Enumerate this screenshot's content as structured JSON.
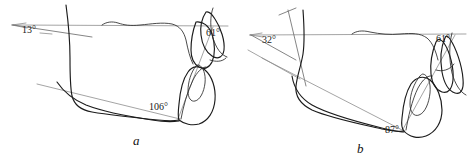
{
  "figure": {
    "title": "",
    "panels": [
      {
        "id": "a",
        "label": "a",
        "angles": [
          {
            "name": "pastern-axis-to-horizontal",
            "value": "13",
            "unit": "°",
            "text": "13°"
          },
          {
            "name": "dorsal-hoof-wall-angle",
            "value": "61",
            "unit": "°",
            "text": "61°"
          },
          {
            "name": "toe-to-ground-angle",
            "value": "106",
            "unit": "°",
            "text": "106°"
          }
        ]
      },
      {
        "id": "b",
        "label": "b",
        "angles": [
          {
            "name": "pastern-axis-to-horizontal",
            "value": "32",
            "unit": "°",
            "text": "32°"
          },
          {
            "name": "dorsal-hoof-wall-angle",
            "value": "61",
            "unit": "°",
            "text": "61°"
          },
          {
            "name": "toe-to-ground-angle",
            "value": "87",
            "unit": "°",
            "text": "87°"
          }
        ]
      }
    ],
    "colors": {
      "outline": "#1b1b1b",
      "reference_line": "#8d8d8d",
      "background": "#ffffff",
      "text": "#1a1a1a"
    }
  }
}
